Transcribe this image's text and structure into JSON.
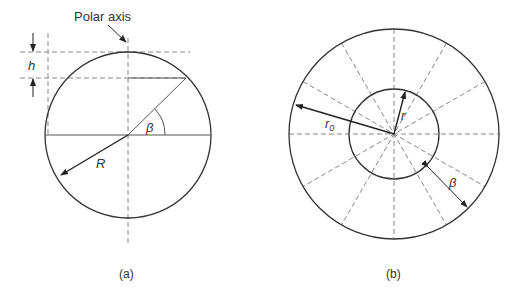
{
  "figure_a": {
    "caption": "(a)",
    "labels": {
      "polar_axis": "Polar axis",
      "h": "h",
      "beta": "β",
      "R": "R"
    }
  },
  "figure_b": {
    "caption": "(b)",
    "labels": {
      "r0": "r",
      "r0_sub": "0",
      "r": "r",
      "beta": "β"
    }
  },
  "colors": {
    "stroke": "#333333",
    "dash": "#888888"
  }
}
